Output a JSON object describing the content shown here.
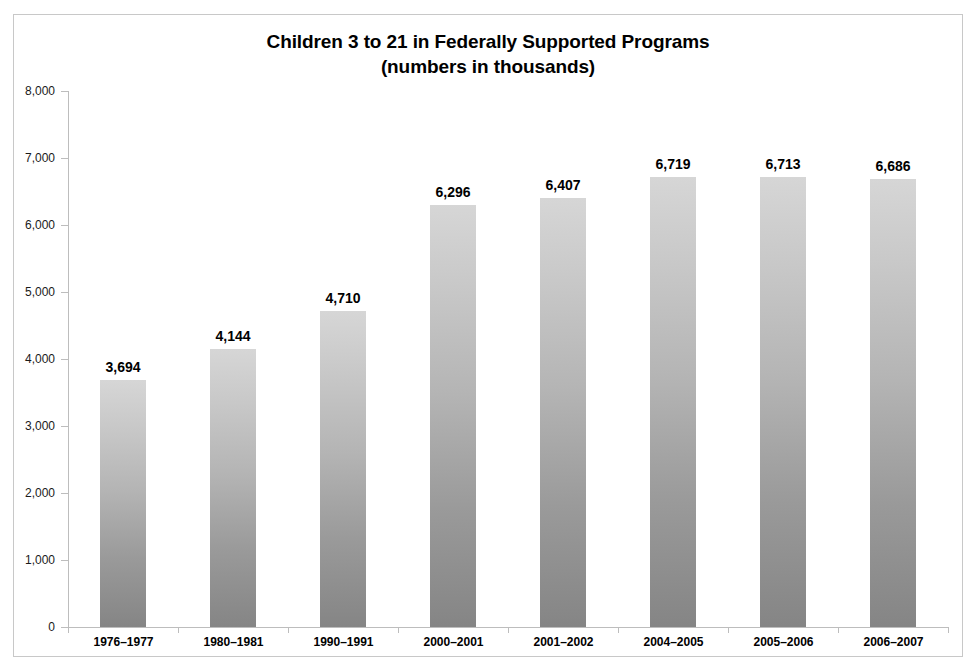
{
  "chart_data": {
    "type": "bar",
    "title": "Children 3 to 21 in Federally Supported Programs",
    "subtitle": "(numbers in thousands)",
    "xlabel": "",
    "ylabel": "",
    "ylim": [
      0,
      8000
    ],
    "ytick_labels": [
      "8,000",
      "7,000",
      "6,000",
      "5,000",
      "4,000",
      "3,000",
      "2,000",
      "1,000",
      "0"
    ],
    "ytick_values": [
      8000,
      7000,
      6000,
      5000,
      4000,
      3000,
      2000,
      1000,
      0
    ],
    "grid": false,
    "legend": "none",
    "categories": [
      "1976–1977",
      "1980–1981",
      "1990–1991",
      "2000–2001",
      "2001–2002",
      "2004–2005",
      "2005–2006",
      "2006–2007"
    ],
    "values": [
      3694,
      4144,
      4710,
      6296,
      6407,
      6719,
      6713,
      6686
    ],
    "value_labels": [
      "3,694",
      "4,144",
      "4,710",
      "6,296",
      "6,407",
      "6,719",
      "6,713",
      "6,686"
    ],
    "bar_color_top": "#d6d6d6",
    "bar_color_bottom": "#858585",
    "axis_color": "#bdbdbd",
    "text_color": "#000000",
    "border_color": "#c8c8c8"
  }
}
